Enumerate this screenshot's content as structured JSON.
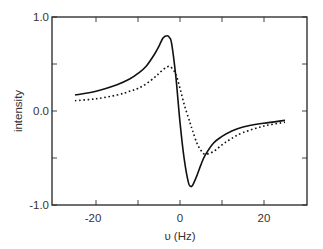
{
  "chart_data": {
    "type": "line",
    "title": "",
    "xlabel": "υ (Hz)",
    "ylabel": "intensity",
    "xlim": [
      -30.5,
      30.2
    ],
    "ylim": [
      -1.0,
      1.0
    ],
    "x_ticks": [
      -20,
      -10,
      0,
      10,
      20
    ],
    "x_tick_labels": [
      "-20",
      "",
      "0",
      "",
      "20"
    ],
    "y_ticks": [
      1.0,
      0.5,
      0.0,
      -0.5,
      -1.0
    ],
    "y_tick_labels": [
      "1.0",
      "",
      "0.0",
      "",
      "-1.0"
    ],
    "grid": false,
    "legend": null,
    "x": [
      -25,
      -20,
      -15,
      -12,
      -10,
      -8,
      -6,
      -5,
      -4,
      -3,
      -2.5,
      -2,
      -1,
      0,
      1,
      2,
      2.5,
      3,
      4,
      5,
      6,
      8,
      10,
      12,
      15,
      20,
      25
    ],
    "series": [
      {
        "name": "solid",
        "style": "solid",
        "values": [
          0.17,
          0.21,
          0.28,
          0.34,
          0.4,
          0.48,
          0.61,
          0.69,
          0.78,
          0.8,
          0.78,
          0.72,
          0.37,
          -0.12,
          -0.51,
          -0.76,
          -0.8,
          -0.79,
          -0.69,
          -0.57,
          -0.47,
          -0.34,
          -0.27,
          -0.22,
          -0.17,
          -0.13,
          -0.1
        ]
      },
      {
        "name": "dotted",
        "style": "dotted",
        "values": [
          0.11,
          0.13,
          0.17,
          0.21,
          0.24,
          0.29,
          0.36,
          0.4,
          0.44,
          0.47,
          0.47,
          0.46,
          0.39,
          0.24,
          0.07,
          -0.07,
          -0.14,
          -0.21,
          -0.34,
          -0.42,
          -0.46,
          -0.43,
          -0.36,
          -0.3,
          -0.23,
          -0.16,
          -0.12
        ]
      }
    ]
  }
}
